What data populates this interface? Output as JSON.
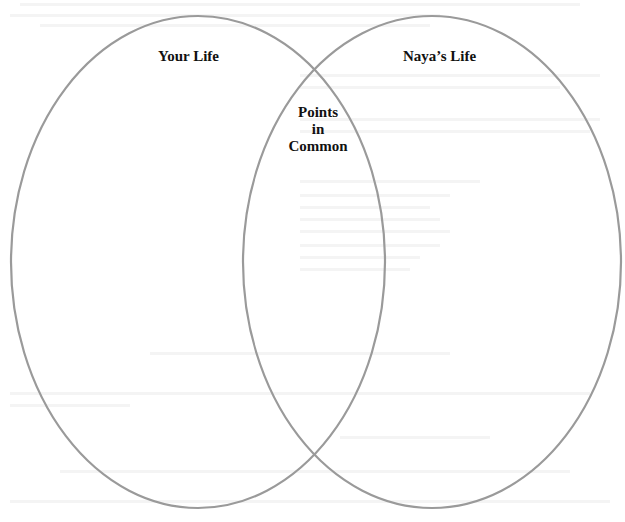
{
  "diagram": {
    "type": "venn",
    "sets": [
      {
        "id": "left",
        "label": "Your Life"
      },
      {
        "id": "right",
        "label": "Naya’s Life"
      }
    ],
    "intersection": {
      "label_lines": [
        "Points",
        "in",
        "Common"
      ]
    },
    "colors": {
      "outline": "#9a9a9a",
      "text": "#111111",
      "background": "#ffffff"
    }
  }
}
